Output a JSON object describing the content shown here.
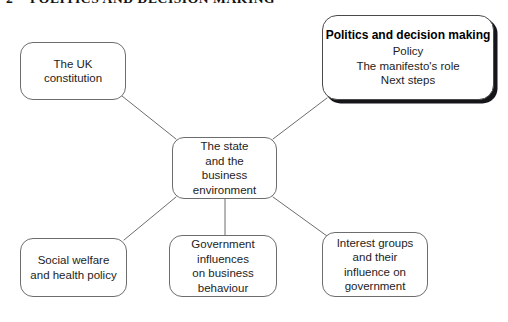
{
  "page": {
    "folio": "2",
    "running_head": "POLITICS AND DECISION MAKING",
    "background": "#ffffff",
    "line_color": "#6d6d6d",
    "text_color": "#1d1d1d",
    "shadow_color": "#15151a"
  },
  "diagram": {
    "type": "concept-map",
    "hub": {
      "id": "state-business-environment",
      "lines": [
        "The state",
        "and the",
        "business",
        "environment"
      ]
    },
    "nodes": [
      {
        "id": "uk-constitution",
        "lines": [
          "The UK",
          "constitution"
        ],
        "highlighted": false
      },
      {
        "id": "politics-decision-making",
        "title": "Politics and decision making",
        "lines": [
          "Policy",
          "The manifesto's role",
          "Next steps"
        ],
        "highlighted": true
      },
      {
        "id": "social-welfare-health-policy",
        "lines": [
          "Social welfare",
          "and health policy"
        ],
        "highlighted": false
      },
      {
        "id": "government-influences-business",
        "lines": [
          "Government",
          "influences",
          "on business",
          "behaviour"
        ],
        "highlighted": false
      },
      {
        "id": "interest-groups-government",
        "lines": [
          "Interest groups",
          "and their",
          "influence on",
          "government"
        ],
        "highlighted": false
      }
    ],
    "connectors": [
      {
        "from": "uk-constitution",
        "to": "state-business-environment"
      },
      {
        "from": "politics-decision-making",
        "to": "state-business-environment"
      },
      {
        "from": "state-business-environment",
        "to": "social-welfare-health-policy"
      },
      {
        "from": "state-business-environment",
        "to": "government-influences-business"
      },
      {
        "from": "state-business-environment",
        "to": "interest-groups-government"
      }
    ]
  }
}
